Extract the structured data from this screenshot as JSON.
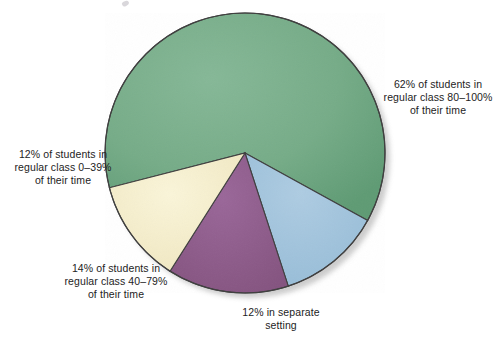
{
  "figure": {
    "background_color": "#ffffff",
    "width": 497,
    "height": 337
  },
  "chart_data": {
    "type": "pie",
    "title": "",
    "subtitle": "",
    "xlabel": "",
    "ylabel": "",
    "legend_position": "callout-labels",
    "grid": false,
    "units": "percent",
    "total": 100,
    "start_angle_deg_clockwise_from_north": 255.6,
    "direction": "clockwise",
    "center": {
      "x": 245,
      "y": 153
    },
    "radius": 140,
    "categories": [
      "62% of students in regular class 80–100% of their time",
      "12% in separate setting",
      "14% of students in regular class 40–79% of their time",
      "12% of students in regular class 0–39% of their time"
    ],
    "values": [
      62,
      12,
      14,
      12
    ],
    "colors": [
      "#74ab86",
      "#a0c4dd",
      "#8d5b8e",
      "#f5eecb"
    ],
    "slices": [
      {
        "name": "regular-class-80-100",
        "value": 62,
        "value_label": "62%",
        "color": "#74ab86",
        "angle_deg": 223.2,
        "label_lines": [
          "62% of students in",
          "regular class 80–100%",
          "of their time"
        ],
        "label_position": "right"
      },
      {
        "name": "separate-setting",
        "value": 12,
        "value_label": "12%",
        "color": "#a0c4dd",
        "angle_deg": 43.2,
        "label_lines": [
          "12% in separate",
          "setting"
        ],
        "label_position": "bottom"
      },
      {
        "name": "regular-class-40-79",
        "value": 14,
        "value_label": "14%",
        "color": "#8d5b8e",
        "angle_deg": 50.4,
        "label_lines": [
          "14% of students in",
          "regular class 40–79%",
          "of their time"
        ],
        "label_position": "bottom-left"
      },
      {
        "name": "regular-class-0-39",
        "value": 12,
        "value_label": "12%",
        "color": "#f5eecb",
        "angle_deg": 43.2,
        "label_lines": [
          "12% of students in",
          "regular class 0–39%",
          "of their time"
        ],
        "label_position": "left"
      }
    ],
    "outline_color": "#3a3a3a",
    "shadow_color": "#c9c9c9"
  },
  "labels": {
    "right": "62% of students in\nregular class 80–100%\nof their time",
    "left": "12% of students in\nregular class 0–39%\nof their time",
    "bottom_left": "14% of students in\nregular class 40–79%\nof their time",
    "bottom": "12% in separate\nsetting"
  }
}
